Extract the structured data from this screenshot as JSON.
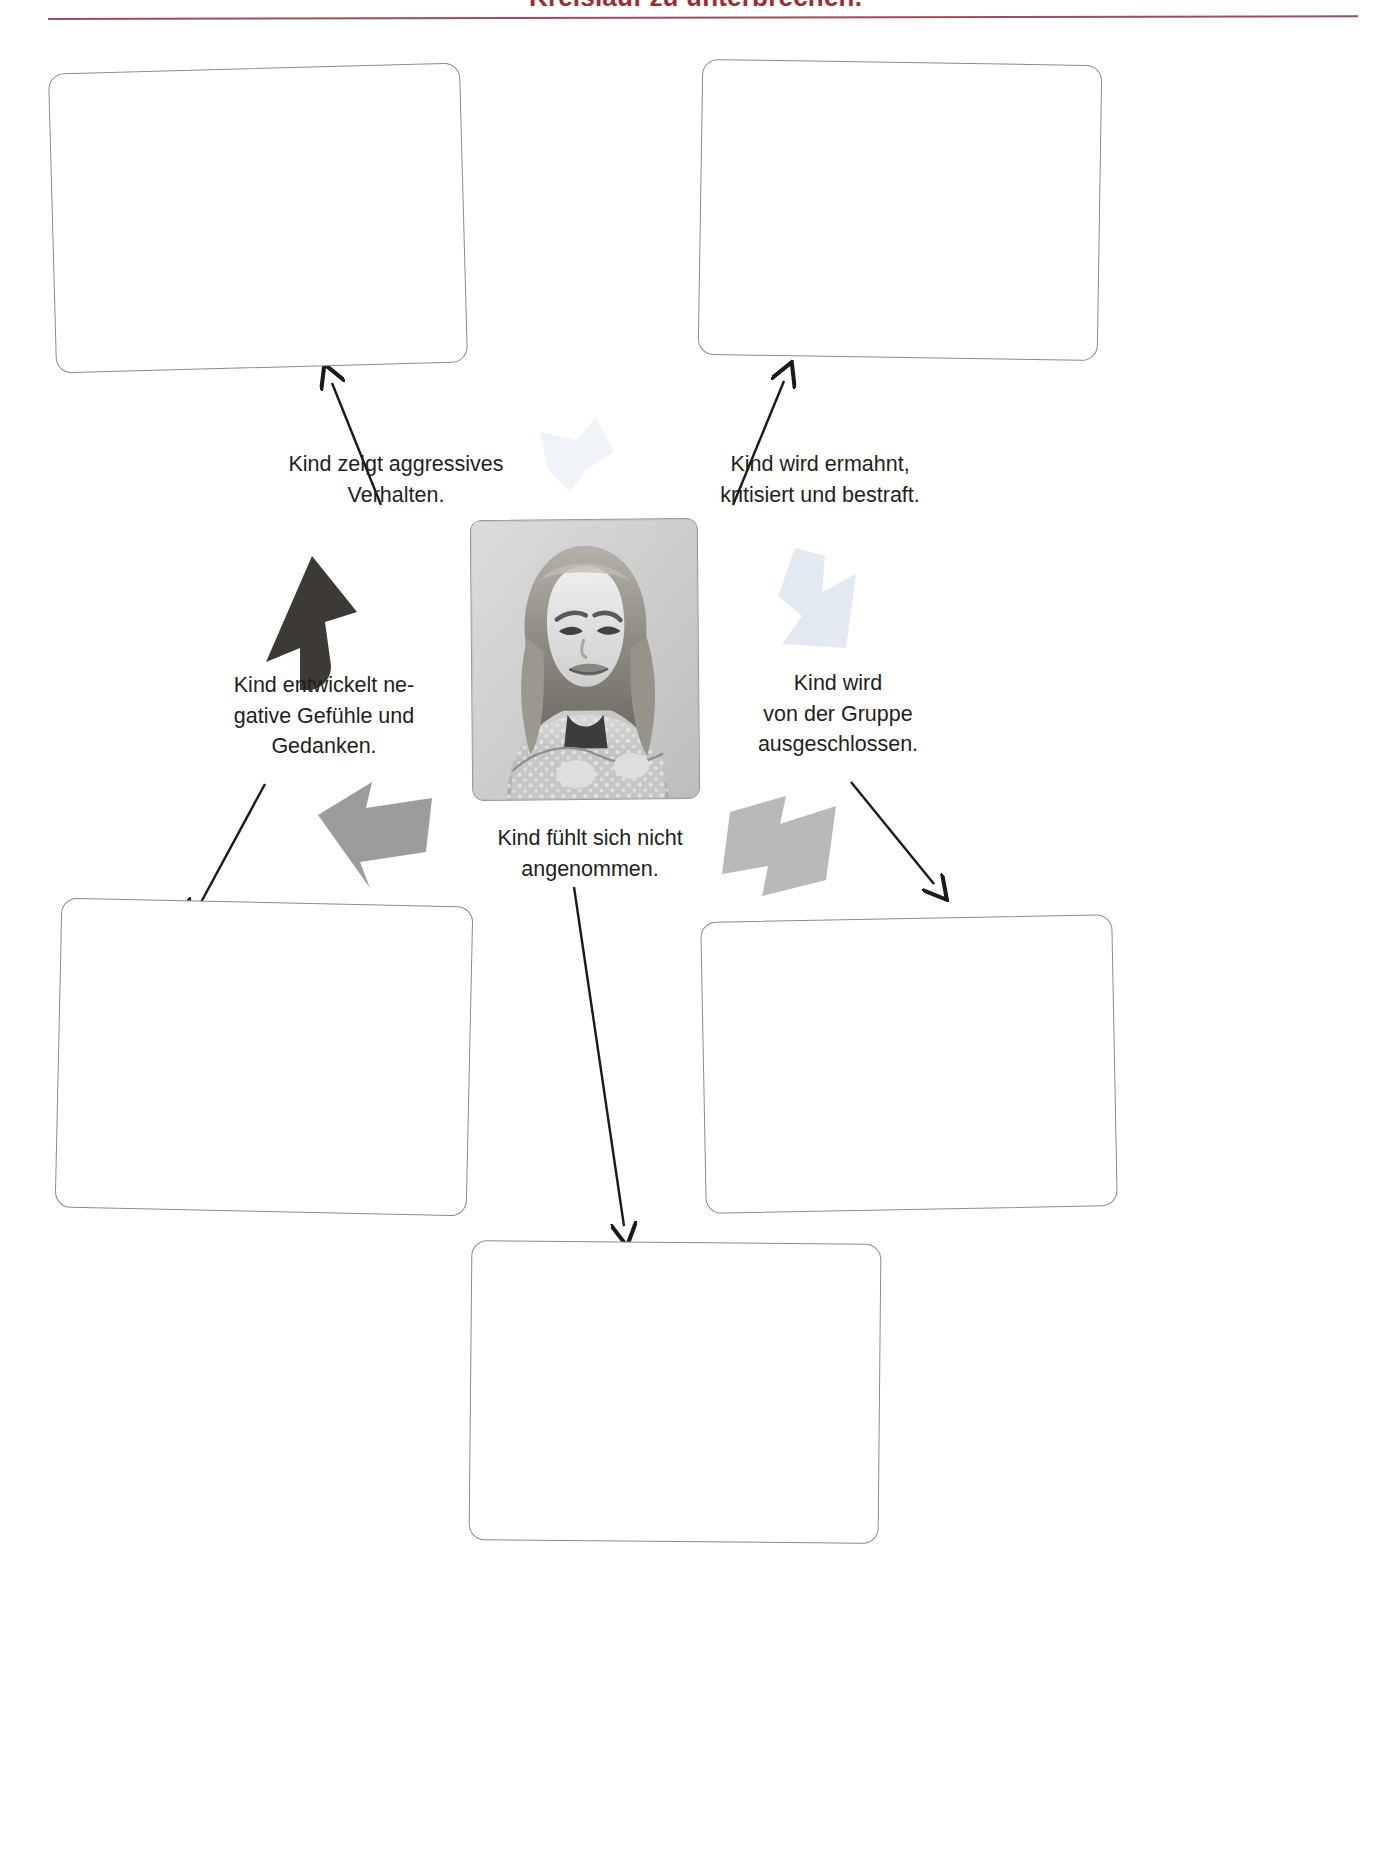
{
  "header": {
    "title": "Kreislauf zu unterbrechen.",
    "accent_color": "#8d2f3a"
  },
  "diagram": {
    "center_photo": {
      "name": "pouting-girl-photo",
      "description": "Schwarz-weiss Foto: trotziges Maedchen mit verschraenkten Armen"
    },
    "labels": [
      {
        "id": "aggressives-verhalten",
        "line1": "Kind zeigt aggressives",
        "line2": "Verhalten."
      },
      {
        "id": "ermahnt-kritisiert",
        "line1": "Kind wird ermahnt,",
        "line2": "kritisiert und bestraft."
      },
      {
        "id": "negative-gefuehle",
        "line1": "Kind entwickelt ne-",
        "line2": "gative Gefühle und",
        "line3": "Gedanken."
      },
      {
        "id": "gruppe-ausgeschlossen",
        "line1": "Kind wird",
        "line2": "von der Gruppe",
        "line3": "ausgeschlossen."
      },
      {
        "id": "nicht-angenommen",
        "line1": "Kind fühlt sich nicht",
        "line2": "angenommen."
      }
    ],
    "answer_boxes": [
      {
        "id": "box-top-left",
        "value": ""
      },
      {
        "id": "box-top-right",
        "value": ""
      },
      {
        "id": "box-bottom-left",
        "value": ""
      },
      {
        "id": "box-bottom-right",
        "value": ""
      },
      {
        "id": "box-bottom-center",
        "value": ""
      }
    ],
    "arrows": [
      {
        "id": "arrow-to-top-left-box",
        "style": "thin-line",
        "color": "#1a1a1a"
      },
      {
        "id": "arrow-to-top-right-box",
        "style": "thin-line",
        "color": "#1a1a1a"
      },
      {
        "id": "arrow-to-bottom-left-box",
        "style": "thin-line",
        "color": "#1a1a1a"
      },
      {
        "id": "arrow-to-bottom-right-box",
        "style": "thin-line",
        "color": "#1a1a1a"
      },
      {
        "id": "arrow-to-bottom-center-box",
        "style": "thin-line",
        "color": "#1a1a1a"
      },
      {
        "id": "cycle-arrow-up-left",
        "style": "block-bold",
        "color": "#3d3935"
      },
      {
        "id": "cycle-arrow-up-right",
        "style": "block-bold",
        "color": "#edf1f5"
      },
      {
        "id": "cycle-arrow-down-right",
        "style": "block-bold",
        "color": "#e4eaf0"
      },
      {
        "id": "cycle-arrow-left-lower",
        "style": "block-bold",
        "color": "#9b9b9b"
      },
      {
        "id": "cycle-arrow-left-from-right",
        "style": "block-bold",
        "color": "#b4b4b4"
      }
    ]
  }
}
